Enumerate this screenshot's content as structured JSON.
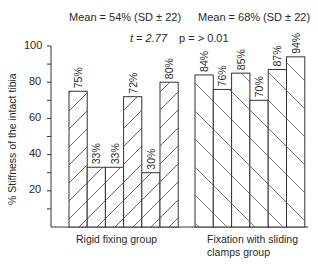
{
  "chart_data": {
    "type": "bar",
    "title": "",
    "ylabel": "% Stiffness of the intact tibia",
    "xlabel": "",
    "ylim": [
      0,
      100
    ],
    "yticks": [
      20,
      40,
      60,
      80,
      100
    ],
    "grid": false,
    "bar_fill": "diagonal hatch",
    "groups": [
      {
        "name": "Rigid fixing group",
        "mean_label": "Mean = 54% (SD ± 22)",
        "values": [
          75,
          33,
          33,
          72,
          30,
          80
        ],
        "labels": [
          "75%",
          "33%",
          "33%",
          "72%",
          "30%",
          "80%"
        ]
      },
      {
        "name": "Fixation with sliding clamps group",
        "mean_label": "Mean = 68% (SD ± 22)",
        "values": [
          84,
          76,
          85,
          70,
          87,
          94
        ],
        "labels": [
          "84%",
          "76%",
          "85%",
          "70%",
          "87%",
          "94%"
        ]
      }
    ],
    "annotations": [
      "t = 2.77",
      "p = > 0.01"
    ]
  },
  "header": {
    "mean_left": "Mean = 54% (SD ± 22)",
    "mean_right": "Mean = 68% (SD ± 22)",
    "stat_t": "t = 2.77",
    "stat_p": "p = > 0.01"
  },
  "axis": {
    "ylabel": "% Stiffness of the intact tibia",
    "ticks": [
      "100",
      "80",
      "60",
      "40",
      "20"
    ]
  },
  "groups": {
    "left_label": "Rigid fixing group",
    "right_label_line1": "Fixation with sliding",
    "right_label_line2": "clamps group"
  }
}
